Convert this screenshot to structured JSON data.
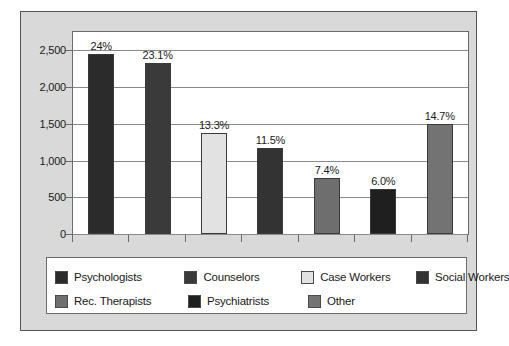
{
  "chart_data": {
    "type": "bar",
    "title": "",
    "xlabel": "",
    "ylabel": "",
    "ylim": [
      0,
      2750
    ],
    "grid": true,
    "legend_position": "bottom",
    "categories": [
      "Psychologists",
      "Counselors",
      "Case Workers",
      "Social Workers",
      "Rec. Therapists",
      "Psychiatrists",
      "Other"
    ],
    "values": [
      2450,
      2330,
      1370,
      1170,
      760,
      610,
      1500
    ],
    "data_labels": [
      "24%",
      "23.1%",
      "13.3%",
      "11.5%",
      "7.4%",
      "6.0%",
      "14.7%"
    ],
    "percentages": [
      24.0,
      23.1,
      13.3,
      11.5,
      7.4,
      6.0,
      14.7
    ],
    "bar_colors": [
      "#2b2b2b",
      "#3a3a3a",
      "#e2e2e2",
      "#333333",
      "#6e6e6e",
      "#1f1f1f",
      "#737373"
    ],
    "y_ticks": [
      {
        "label": "0",
        "value": 0
      },
      {
        "label": "500",
        "value": 500
      },
      {
        "label": "1,000",
        "value": 1000
      },
      {
        "label": "1,500",
        "value": 1500
      },
      {
        "label": "2,000",
        "value": 2000
      },
      {
        "label": "2,500",
        "value": 2500
      }
    ],
    "legend": [
      {
        "label": "Psychologists",
        "color": "#2b2b2b"
      },
      {
        "label": "Counselors",
        "color": "#3a3a3a"
      },
      {
        "label": "Case Workers",
        "color": "#e2e2e2"
      },
      {
        "label": "Social Workers",
        "color": "#333333"
      },
      {
        "label": "Rec. Therapists",
        "color": "#6e6e6e"
      },
      {
        "label": "Psychiatrists",
        "color": "#1f1f1f"
      },
      {
        "label": "Other",
        "color": "#737373"
      }
    ]
  },
  "colors": {
    "frame_background": "#d9d9d9",
    "plot_background": "#ffffff",
    "gridline": "#8a8a8a",
    "axis": "#6b6b6b",
    "text": "#1a1a1a"
  }
}
